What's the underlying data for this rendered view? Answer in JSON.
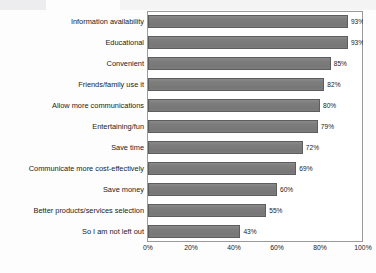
{
  "chart_data": {
    "type": "bar",
    "orientation": "horizontal",
    "title": "",
    "xlabel": "",
    "ylabel": "",
    "xlim": [
      0,
      100
    ],
    "grid": false,
    "legend": false,
    "categories": [
      "Information availability",
      "Educational",
      "Convenient",
      "Friends/family use it",
      "Allow more communications",
      "Entertaining/fun",
      "Save time",
      "Communicate more cost-effectively",
      "Save money",
      "Better products/services selection",
      "So I am not left out"
    ],
    "values": [
      93,
      93,
      85,
      82,
      80,
      79,
      72,
      69,
      60,
      55,
      43
    ],
    "value_labels": [
      "93%",
      "93%",
      "85%",
      "82%",
      "80%",
      "79%",
      "72%",
      "69%",
      "60%",
      "55%",
      "43%"
    ],
    "xticks": [
      0,
      20,
      40,
      60,
      80,
      100
    ],
    "xtick_labels": [
      "0%",
      "20%",
      "40%",
      "60%",
      "80%",
      "100%"
    ],
    "colors": {
      "bar_fill": "#7d7d7d",
      "bar_border": "#5d5d5d",
      "frame": "#9a9a9a",
      "text": "#1b1b1b",
      "background": "#fdfdfd"
    }
  }
}
